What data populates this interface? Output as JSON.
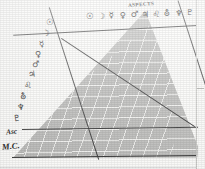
{
  "document": {
    "title": "ASPECTS",
    "kind": "astrological-aspectarian-grid"
  },
  "table": {
    "title": "ASPECTS",
    "column_headers": [
      {
        "name": "sun-glyph",
        "symbol": "☉"
      },
      {
        "name": "moon-glyph",
        "symbol": "☽"
      },
      {
        "name": "mercury-glyph",
        "symbol": "☿"
      },
      {
        "name": "venus-glyph",
        "symbol": "♀"
      },
      {
        "name": "mars-glyph",
        "symbol": "♂"
      },
      {
        "name": "jupiter-glyph",
        "symbol": "♃"
      },
      {
        "name": "saturn-glyph",
        "symbol": "♌"
      },
      {
        "name": "uranus-glyph",
        "symbol": "⛢"
      },
      {
        "name": "neptune-glyph",
        "symbol": "♆"
      },
      {
        "name": "pluto-glyph",
        "symbol": "♇"
      }
    ],
    "row_headers": [
      {
        "name": "sun-glyph",
        "symbol": "☉"
      },
      {
        "name": "moon-glyph",
        "symbol": "☽"
      },
      {
        "name": "mercury-glyph",
        "symbol": "☿"
      },
      {
        "name": "venus-glyph",
        "symbol": "♀"
      },
      {
        "name": "mars-glyph",
        "symbol": "♂"
      },
      {
        "name": "jupiter-glyph",
        "symbol": "♃"
      },
      {
        "name": "saturn-glyph",
        "symbol": "♌"
      },
      {
        "name": "uranus-glyph",
        "symbol": "⛢"
      },
      {
        "name": "neptune-glyph",
        "symbol": "♆"
      },
      {
        "name": "pluto-glyph",
        "symbol": "♇"
      },
      {
        "name": "ascendant-label",
        "symbol": "Asc"
      },
      {
        "name": "midheaven-label",
        "symbol": "M.C."
      }
    ],
    "cells": [],
    "column_count": 10,
    "row_count": 12
  },
  "colors": {
    "paper": "#fcfcfa",
    "field": "#bfbfbd",
    "rule": "#f8f8f6",
    "ink": "#2e2e2e",
    "margin_rule": "#c9c9c6"
  }
}
